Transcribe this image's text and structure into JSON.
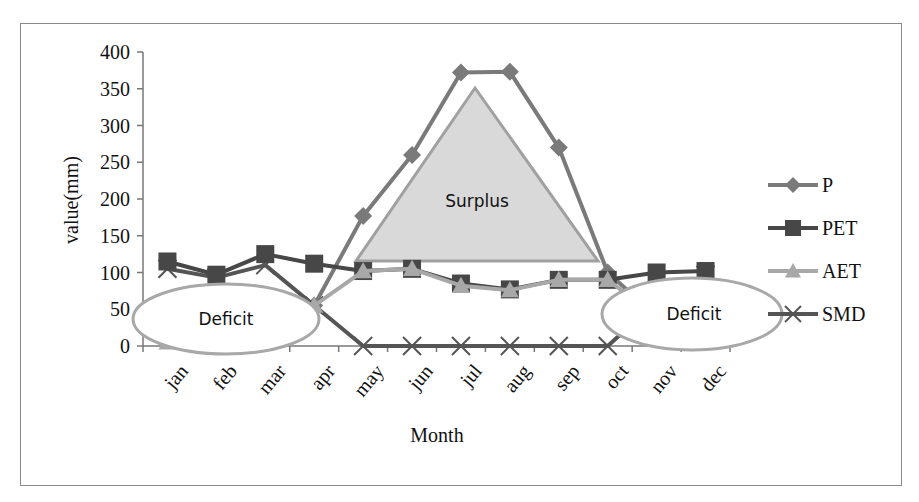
{
  "chart_data": {
    "type": "line",
    "title": "",
    "xlabel": "Month",
    "ylabel": "value(mm)",
    "ylim": [
      0,
      400
    ],
    "yticks": [
      0,
      50,
      100,
      150,
      200,
      250,
      300,
      350,
      400
    ],
    "grid": false,
    "legend_position": "right",
    "categories": [
      "jan",
      "feb",
      "mar",
      "apr",
      "may",
      "jun",
      "jul",
      "aug",
      "sep",
      "oct",
      "nov",
      "dec"
    ],
    "series": [
      {
        "name": "P",
        "marker": "diamond",
        "color": "#7a7a7a",
        "values": [
          10,
          5,
          15,
          55,
          177,
          260,
          372,
          373,
          270,
          100,
          40,
          5
        ]
      },
      {
        "name": "PET",
        "marker": "square",
        "color": "#474747",
        "values": [
          115,
          97,
          125,
          112,
          102,
          105,
          85,
          77,
          90,
          90,
          100,
          102
        ]
      },
      {
        "name": "AET",
        "marker": "triangle",
        "color": "#a8a8a8",
        "values": [
          5,
          3,
          10,
          55,
          102,
          105,
          82,
          76,
          90,
          90,
          40,
          5
        ]
      },
      {
        "name": "SMD",
        "marker": "x",
        "color": "#555555",
        "values": [
          105,
          93,
          110,
          55,
          0,
          0,
          0,
          0,
          0,
          0,
          60,
          97
        ]
      }
    ],
    "annotations": [
      {
        "text": "Surplus",
        "shape": "triangle",
        "fill": "#d9d9d9"
      },
      {
        "text": "Deficit",
        "shape": "ellipse",
        "position": "left"
      },
      {
        "text": "Deficit",
        "shape": "ellipse",
        "position": "right"
      }
    ]
  },
  "labels": {
    "ylabel": "value(mm)",
    "xlabel": "Month",
    "surplus": "Surplus",
    "deficit_left": "Deficit",
    "deficit_right": "Deficit"
  }
}
